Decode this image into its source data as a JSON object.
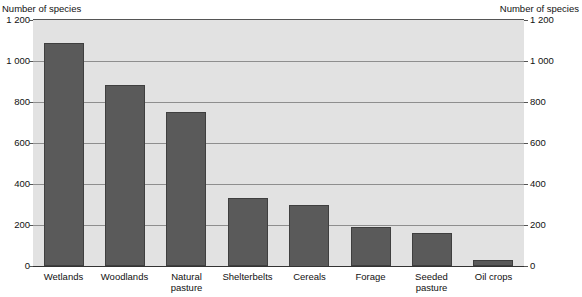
{
  "chart_data": {
    "type": "bar",
    "title": "",
    "subtitle": "",
    "xlabel": "",
    "ylabel": "Number of species",
    "ylabel_right": "Number of species",
    "ylim": [
      0,
      1200
    ],
    "yticks": [
      0,
      200,
      400,
      600,
      800,
      1000,
      1200
    ],
    "ytick_labels": [
      "0",
      "200",
      "400",
      "600",
      "800",
      "1 000",
      "1 200"
    ],
    "grid": true,
    "legend": "none",
    "categories": [
      "Wetlands",
      "Woodlands",
      "Natural pasture",
      "Shelterbelts",
      "Cereals",
      "Forage",
      "Seeded pasture",
      "Oil crops"
    ],
    "values": [
      1090,
      885,
      750,
      330,
      300,
      190,
      160,
      30
    ],
    "bar_color": "#5a5a5a",
    "plot_background": "#e2e2e2",
    "page_background": "#ffffff",
    "gridline_color": "#8e8e8e"
  },
  "axis": {
    "left_title": "Number of species",
    "right_title": "Number of species"
  },
  "category_labels": [
    {
      "line1": "Wetlands",
      "line2": ""
    },
    {
      "line1": "Woodlands",
      "line2": ""
    },
    {
      "line1": "Natural",
      "line2": "pasture"
    },
    {
      "line1": "Shelterbelts",
      "line2": ""
    },
    {
      "line1": "Cereals",
      "line2": ""
    },
    {
      "line1": "Forage",
      "line2": ""
    },
    {
      "line1": "Seeded",
      "line2": "pasture"
    },
    {
      "line1": "Oil crops",
      "line2": ""
    }
  ]
}
